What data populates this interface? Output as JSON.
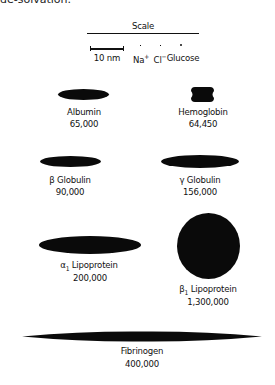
{
  "header_fragment": "de-solvation.",
  "scale": {
    "title": "Scale",
    "bar_label": "10 nm",
    "particles": [
      {
        "name": "Na",
        "charge": "+"
      },
      {
        "name": "Cl",
        "charge": "−"
      },
      {
        "name": "Glucose",
        "charge": ""
      }
    ]
  },
  "proteins": [
    {
      "name": "Albumin",
      "weight": "65,000",
      "shape": "ellipse"
    },
    {
      "name": "Hemoglobin",
      "weight": "64,450",
      "shape": "notched-rectangle"
    },
    {
      "name": "β Globulin",
      "weight": "90,000",
      "shape": "ellipse"
    },
    {
      "name": "γ Globulin",
      "weight": "156,000",
      "shape": "ellipse"
    },
    {
      "name_prefix": "α",
      "name_sub": "1",
      "name_suffix": " Lipoprotein",
      "weight": "200,000",
      "shape": "ellipse"
    },
    {
      "name_prefix": "β",
      "name_sub": "1",
      "name_suffix": " Lipoprotein",
      "weight": "1,300,000",
      "shape": "circle"
    },
    {
      "name": "Fibrinogen",
      "weight": "400,000",
      "shape": "elongated-ellipse"
    }
  ],
  "colors": {
    "shape_fill": "#0a0a0a",
    "background": "#ffffff"
  }
}
